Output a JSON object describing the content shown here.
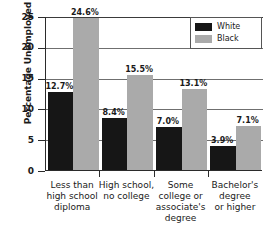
{
  "chart_data": {
    "type": "bar",
    "title": "",
    "xlabel": "",
    "ylabel": "Percentage Unemployed",
    "ylim": [
      0,
      25
    ],
    "yticks": [
      0,
      5,
      10,
      15,
      20,
      25
    ],
    "ytick_labels": [
      "0",
      "5",
      "10",
      "15",
      "20",
      "25"
    ],
    "grid": true,
    "grid_axis": "y",
    "legend_position": "top-right",
    "categories": [
      "Less than high school diploma",
      "High school, no college",
      "Some college or associate's degree",
      "Bachelor's degree or higher"
    ],
    "category_lines": [
      [
        "Less than",
        "high school",
        "diploma"
      ],
      [
        "High school,",
        "no college"
      ],
      [
        "Some",
        "college or",
        "associate's",
        "degree"
      ],
      [
        "Bachelor's",
        "degree",
        "or higher"
      ]
    ],
    "series": [
      {
        "name": "White",
        "color": "#161616",
        "values": [
          12.7,
          8.4,
          7.0,
          3.9
        ],
        "labels": [
          "12.7%",
          "8.4%",
          "7.0%",
          "3.9%"
        ]
      },
      {
        "name": "Black",
        "color": "#aaaaaa",
        "values": [
          24.6,
          15.5,
          13.1,
          7.1
        ],
        "labels": [
          "24.6%",
          "15.5%",
          "13.1%",
          "7.1%"
        ]
      }
    ]
  },
  "legend": {
    "entries": [
      {
        "label": "White",
        "swatch": "#161616"
      },
      {
        "label": "Black",
        "swatch": "#aaaaaa"
      }
    ]
  }
}
